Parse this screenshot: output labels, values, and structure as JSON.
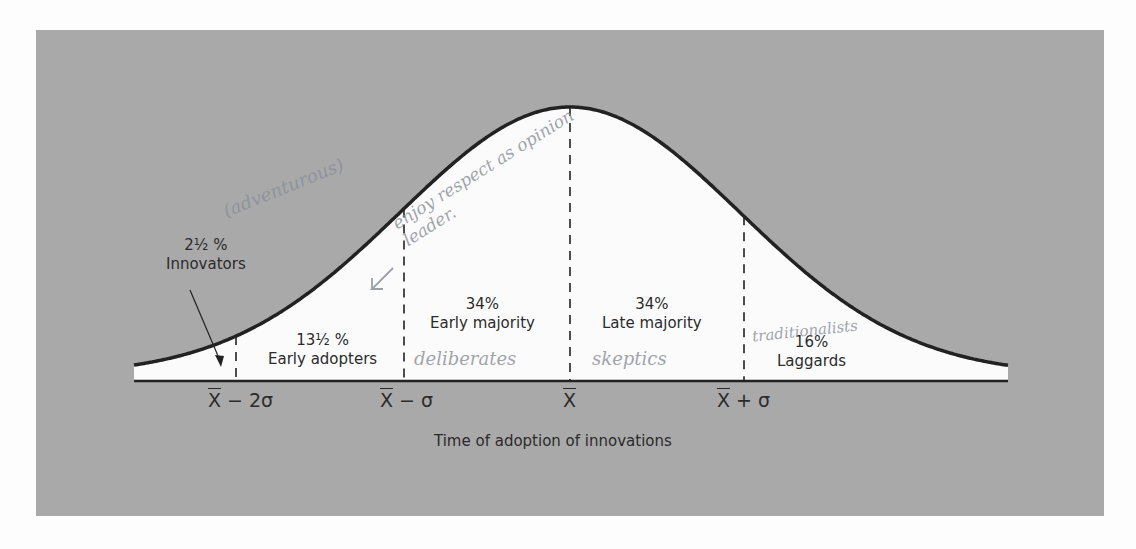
{
  "chart_data": {
    "type": "area",
    "title": "",
    "xlabel": "Time of adoption of innovations",
    "ylabel": "",
    "distribution": "normal",
    "tick_labels": [
      "X̄ − 2σ",
      "X̄ − σ",
      "X̄",
      "X̄ + σ"
    ],
    "categories": [
      "Innovators",
      "Early adopters",
      "Early majority",
      "Late majority",
      "Laggards"
    ],
    "values": [
      2.5,
      13.5,
      34,
      34,
      16
    ],
    "value_labels": [
      "2½ %",
      "13½ %",
      "34%",
      "34%",
      "16%"
    ],
    "boundaries": [
      "X̄ − 2σ",
      "X̄ − σ",
      "X̄",
      "X̄ + σ"
    ],
    "grid": false,
    "legend": "none"
  },
  "segments": [
    {
      "pct": "2½ %",
      "name": "Innovators"
    },
    {
      "pct": "13½ %",
      "name": "Early adopters"
    },
    {
      "pct": "34%",
      "name": "Early majority"
    },
    {
      "pct": "34%",
      "name": "Late majority"
    },
    {
      "pct": "16%",
      "name": "Laggards"
    }
  ],
  "ticks": {
    "minus2sigma": {
      "x": "X",
      "rest": " − 2σ"
    },
    "minus1sigma": {
      "x": "X",
      "rest": " − σ"
    },
    "mean": {
      "x": "X",
      "rest": ""
    },
    "plus1sigma": {
      "x": "X",
      "rest": " + σ"
    }
  },
  "handwritten": {
    "innovators": "(adventurous)",
    "early_adopters": "enjoy respect as opinion leader.",
    "early_majority": "deliberates",
    "late_majority": "skeptics",
    "laggards": "traditionalists"
  },
  "colors": {
    "panel": "#a9a9a9",
    "curve_fill": "#fbfbfb",
    "curve_line": "#222222",
    "text": "#2b2b2b",
    "pencil": "#8a8f99"
  }
}
